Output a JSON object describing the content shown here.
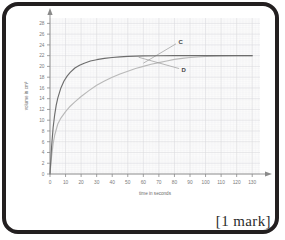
{
  "frame": {
    "border_color": "#231f20"
  },
  "footer": {
    "mark_note": "[1 mark]"
  },
  "chart_data": {
    "type": "line",
    "title": "",
    "xlabel": "time in seconds",
    "ylabel": "volume in cm³",
    "xlim": [
      0,
      135
    ],
    "ylim": [
      0,
      29
    ],
    "xticks": [
      0,
      10,
      20,
      30,
      40,
      50,
      60,
      70,
      80,
      90,
      100,
      110,
      120,
      130
    ],
    "yticks": [
      0,
      2,
      4,
      6,
      8,
      10,
      12,
      14,
      16,
      18,
      20,
      22,
      24,
      26,
      28
    ],
    "grid": true,
    "grid_minor_step_x": 2,
    "grid_minor_step_y": 0.4,
    "legend": "none",
    "plot_background": "#fbfbfb",
    "grid_major_color": "#d8d8dd",
    "grid_minor_color": "#ededf0",
    "axis_color": "#8a8a8a",
    "series": [
      {
        "name": "C",
        "color": "#b9b9b9",
        "label": "C",
        "label_x": 84,
        "label_y": 24.6,
        "leader_from_x": 60,
        "leader_from_y": 20.6,
        "leader_to_x": 81,
        "leader_to_y": 24.2,
        "x": [
          0,
          1,
          2,
          3,
          5,
          7,
          10,
          13,
          16,
          20,
          25,
          30,
          35,
          40,
          45,
          50,
          55,
          60,
          65,
          70,
          75,
          80,
          85,
          90,
          100,
          110,
          120,
          130
        ],
        "y": [
          0,
          3.2,
          5.6,
          7.2,
          9.3,
          10.4,
          11.6,
          12.6,
          13.4,
          14.4,
          15.5,
          16.5,
          17.3,
          18.0,
          18.6,
          19.1,
          19.6,
          20.0,
          20.4,
          20.7,
          21.0,
          21.3,
          21.5,
          21.65,
          21.85,
          21.95,
          22.0,
          22.0
        ]
      },
      {
        "name": "D",
        "color": "#6d6d6d",
        "label": "D",
        "label_x": 86,
        "label_y": 19.3,
        "leader_from_x": 57,
        "leader_from_y": 21.7,
        "leader_to_x": 83,
        "leader_to_y": 19.6,
        "x": [
          0,
          1,
          2,
          3,
          4,
          5,
          7,
          9,
          11,
          13,
          16,
          19,
          22,
          26,
          30,
          35,
          40,
          45,
          50,
          55,
          60,
          70,
          80,
          90,
          100,
          110,
          120,
          130
        ],
        "y": [
          0,
          5.0,
          8.6,
          11.0,
          12.8,
          14.1,
          16.0,
          17.3,
          18.2,
          18.9,
          19.7,
          20.2,
          20.6,
          21.0,
          21.25,
          21.5,
          21.65,
          21.78,
          21.86,
          21.91,
          21.95,
          21.99,
          22.0,
          22.0,
          22.0,
          22.0,
          22.0,
          22.0
        ]
      }
    ]
  }
}
